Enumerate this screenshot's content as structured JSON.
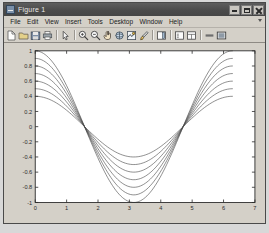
{
  "window": {
    "title": "Figure 1",
    "icon": "figure-icon",
    "buttons": [
      {
        "name": "minimize",
        "label": "Minimize"
      },
      {
        "name": "maximize",
        "label": "Maximize"
      },
      {
        "name": "close",
        "label": "Close"
      }
    ]
  },
  "menubar": {
    "items": [
      {
        "label": "File"
      },
      {
        "label": "Edit"
      },
      {
        "label": "View"
      },
      {
        "label": "Insert"
      },
      {
        "label": "Tools"
      },
      {
        "label": "Desktop"
      },
      {
        "label": "Window"
      },
      {
        "label": "Help"
      }
    ]
  },
  "toolbar": {
    "items": [
      {
        "icon": "new-figure-icon"
      },
      {
        "icon": "open-file-icon"
      },
      {
        "icon": "save-figure-icon"
      },
      {
        "icon": "print-figure-icon"
      },
      {
        "sep": true
      },
      {
        "icon": "edit-plot-arrow-icon"
      },
      {
        "sep": true
      },
      {
        "icon": "zoom-in-icon"
      },
      {
        "icon": "zoom-out-icon"
      },
      {
        "icon": "pan-icon"
      },
      {
        "icon": "rotate-3d-icon"
      },
      {
        "icon": "data-cursor-icon"
      },
      {
        "icon": "brush-icon"
      },
      {
        "sep": true
      },
      {
        "icon": "insert-colorbar-icon"
      },
      {
        "sep": true
      },
      {
        "icon": "insert-legend-icon"
      },
      {
        "icon": "plot-browser-icon"
      },
      {
        "sep": true
      },
      {
        "icon": "hide-plot-tools-icon"
      },
      {
        "icon": "show-plot-tools-icon"
      }
    ]
  },
  "colors": {
    "figure_background": "#d4d0c8",
    "axes_background": "#ffffff",
    "axes_line": "#2b2b2b",
    "curve_line": "#4a4a4a",
    "title_bar": "#4b4b4b"
  },
  "chart_data": {
    "type": "line",
    "title": "",
    "xlabel": "",
    "ylabel": "",
    "xlim": [
      0,
      7
    ],
    "ylim": [
      -1,
      1
    ],
    "xticks": [
      0,
      1,
      2,
      3,
      4,
      5,
      6,
      7
    ],
    "yticks": [
      -1,
      -0.8,
      -0.6,
      -0.4,
      -0.2,
      0,
      0.2,
      0.4,
      0.6,
      0.8,
      1
    ],
    "xtick_labels": [
      "0",
      "1",
      "2",
      "3",
      "4",
      "5",
      "6",
      "7"
    ],
    "ytick_labels": [
      "-1",
      "-0.8",
      "-0.6",
      "-0.4",
      "-0.2",
      "0",
      "0.2",
      "0.4",
      "0.6",
      "0.8",
      "1"
    ],
    "grid": false,
    "legend": null,
    "x_domain": [
      0,
      6.2832
    ],
    "formula": "A*cos(x)",
    "samples": 120,
    "series": [
      {
        "name": "A = 1.0",
        "amplitude": 1.0
      },
      {
        "name": "A = 0.9",
        "amplitude": 0.9
      },
      {
        "name": "A = 0.8",
        "amplitude": 0.8
      },
      {
        "name": "A = 0.7",
        "amplitude": 0.7
      },
      {
        "name": "A = 0.6",
        "amplitude": 0.6
      },
      {
        "name": "A = 0.5",
        "amplitude": 0.5
      },
      {
        "name": "A = 0.4",
        "amplitude": 0.4
      }
    ]
  }
}
